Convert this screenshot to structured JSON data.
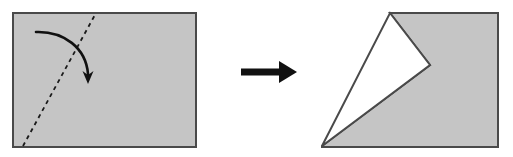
{
  "figure": {
    "canvas": {
      "width": 513,
      "height": 157
    },
    "colors": {
      "paper_fill": "#c5c5c5",
      "paper_stroke": "#4a4a4a",
      "background": "#ffffff",
      "arrow": "#111111",
      "fold_line": "#1a1a1a",
      "notch_fill": "#ffffff"
    }
  },
  "panels": {
    "before": {
      "label": "before-fold-panel",
      "shape_name": "rectangle",
      "rect": {
        "x": 13,
        "y": 13,
        "width": 183,
        "height": 134
      },
      "fold_line": {
        "name": "dashed-fold-line",
        "style": "dashed",
        "dash_pattern": "4 4",
        "stroke_width": 1.8,
        "from": {
          "x": 23,
          "y": 146
        },
        "to": {
          "x": 96,
          "y": 13
        }
      },
      "motion_arrow": {
        "name": "curved-fold-arrow",
        "stroke_width": 2.6,
        "path": "M 36 32 C 64 31, 86 48, 88 74",
        "head": {
          "tip_x": 88,
          "tip_y": 84,
          "half_width": 5.5,
          "length": 13
        }
      }
    },
    "transition": {
      "label": "transition-arrow-panel",
      "arrow": {
        "name": "transition-arrow",
        "direction": "right",
        "shaft": {
          "x1": 241,
          "y1": 72,
          "x2": 282,
          "y2": 72,
          "thickness": 7
        },
        "head": {
          "tip_x": 297,
          "tip_y": 72,
          "back_x": 279,
          "half_width": 11
        }
      }
    },
    "after": {
      "label": "after-fold-panel",
      "shape_name": "folded-paper-with-notch",
      "rect": {
        "x": 322,
        "y": 13,
        "width": 176,
        "height": 134
      },
      "gray_polygon_points": "390,13 498,13 498,147 322,147 322,146 430,65",
      "notch_polygon_points": "390,13 430,65 322,146",
      "vertices": {
        "apex": {
          "x": 390,
          "y": 13
        },
        "notch_point": {
          "x": 430,
          "y": 65
        },
        "bottom_left": {
          "x": 322,
          "y": 146
        },
        "top_right": {
          "x": 498,
          "y": 13
        },
        "bottom_right": {
          "x": 498,
          "y": 147
        }
      }
    }
  }
}
